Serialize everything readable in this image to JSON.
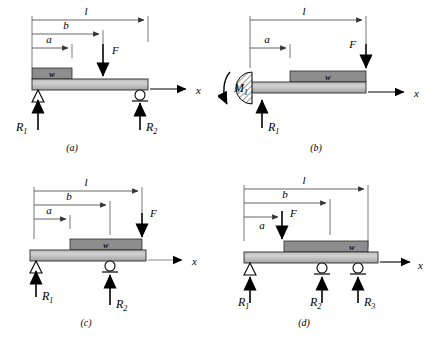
{
  "figure": {
    "background_color": "#ffffff",
    "beam_fill_light": "#cfcfcf",
    "beam_fill_dark": "#a8a8a8",
    "load_block_fill": "#8d8d8d",
    "line_color": "#000000",
    "dimension_line_color": "#555555"
  },
  "panels": [
    {
      "id": "a",
      "caption": "(a)",
      "description": "Simply supported beam, pin at left and roller at right, distributed load w near left, concentrated load F at distance b",
      "dimensions": [
        {
          "name": "l",
          "label": "l"
        },
        {
          "name": "b",
          "label": "b"
        },
        {
          "name": "a",
          "label": "a"
        }
      ],
      "loads": [
        {
          "name": "distributed-load",
          "label": "w"
        },
        {
          "name": "point-load",
          "label": "F"
        }
      ],
      "reactions": [
        {
          "name": "reaction-1",
          "label": "R",
          "subscript": "1",
          "support": "pin"
        },
        {
          "name": "reaction-2",
          "label": "R",
          "subscript": "2",
          "support": "roller"
        }
      ],
      "axis": {
        "label": "x"
      },
      "moment": null
    },
    {
      "id": "b",
      "caption": "(b)",
      "description": "Cantilever beam fixed at left wall with reaction moment M1, distributed load w, concentrated load F at free end",
      "dimensions": [
        {
          "name": "l",
          "label": "l"
        },
        {
          "name": "a",
          "label": "a"
        }
      ],
      "loads": [
        {
          "name": "distributed-load",
          "label": "w"
        },
        {
          "name": "point-load",
          "label": "F"
        }
      ],
      "reactions": [
        {
          "name": "reaction-1",
          "label": "R",
          "subscript": "1",
          "support": "fixed"
        }
      ],
      "axis": {
        "label": "x"
      },
      "moment": {
        "name": "moment-1",
        "label": "M",
        "subscript": "1"
      }
    },
    {
      "id": "c",
      "caption": "(c)",
      "description": "Overhanging beam, pin at left and roller at interior point, distributed load w, concentrated load F at right end",
      "dimensions": [
        {
          "name": "l",
          "label": "l"
        },
        {
          "name": "b",
          "label": "b"
        },
        {
          "name": "a",
          "label": "a"
        }
      ],
      "loads": [
        {
          "name": "distributed-load",
          "label": "w"
        },
        {
          "name": "point-load",
          "label": "F"
        }
      ],
      "reactions": [
        {
          "name": "reaction-1",
          "label": "R",
          "subscript": "1",
          "support": "pin"
        },
        {
          "name": "reaction-2",
          "label": "R",
          "subscript": "2",
          "support": "roller"
        }
      ],
      "axis": {
        "label": "x"
      },
      "moment": null
    },
    {
      "id": "d",
      "caption": "(d)",
      "description": "Continuous beam on three supports, pin at left and two rollers, concentrated load F at distance a, distributed load w",
      "dimensions": [
        {
          "name": "l",
          "label": "l"
        },
        {
          "name": "b",
          "label": "b"
        },
        {
          "name": "a",
          "label": "a"
        }
      ],
      "loads": [
        {
          "name": "distributed-load",
          "label": "w"
        },
        {
          "name": "point-load",
          "label": "F"
        }
      ],
      "reactions": [
        {
          "name": "reaction-1",
          "label": "R",
          "subscript": "1",
          "support": "pin"
        },
        {
          "name": "reaction-2",
          "label": "R",
          "subscript": "2",
          "support": "roller"
        },
        {
          "name": "reaction-3",
          "label": "R",
          "subscript": "3",
          "support": "roller"
        }
      ],
      "axis": {
        "label": "x"
      },
      "moment": null
    }
  ]
}
